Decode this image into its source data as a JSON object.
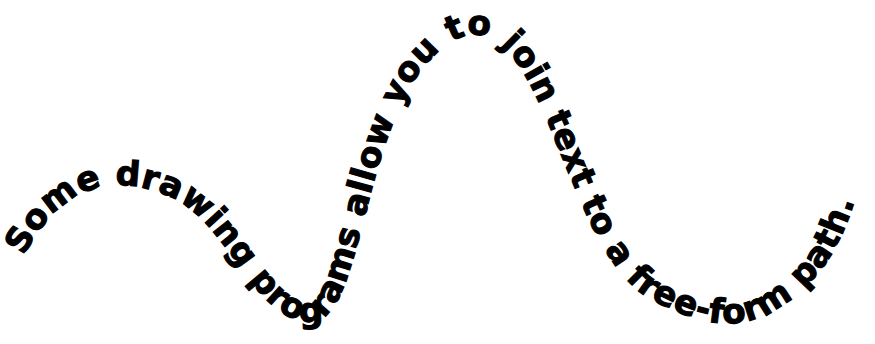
{
  "artwork": {
    "title": "Text on a free-form path",
    "type": "curved-text-illustration",
    "background_color": "#ffffff",
    "text_color": "#000000",
    "content": "Some drawing programs allow you to join text to a free-form path.",
    "font_weight": "bold",
    "font_size_px": 41,
    "path": {
      "description": "free-form S-shaped wave",
      "d": "M 18 268 C 60 176, 120 176, 168 196 C 230 222, 252 320, 310 322 C 368 324, 360 96, 452 42 C 544 -12, 560 252, 652 300 C 720 336, 760 330, 806 286 C 836 258, 848 222, 856 196",
      "start_point": [
        18,
        268
      ],
      "end_point": [
        856,
        196
      ]
    },
    "words": [
      "Some",
      "drawing",
      "programs",
      "allow",
      "you",
      "to",
      "join",
      "text",
      "to",
      "a",
      "free-form",
      "path."
    ],
    "start_offset_percent": 1
  }
}
